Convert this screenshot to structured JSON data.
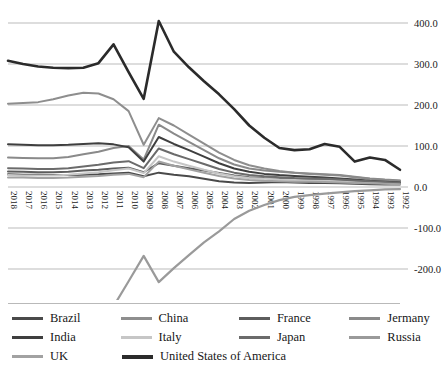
{
  "chart_data": {
    "type": "line",
    "title": "",
    "subtitle": "",
    "xlabel": "",
    "ylabel": "",
    "grid": true,
    "legend_position": "bottom",
    "x_axis_reversed": true,
    "ylim": [
      -300,
      400
    ],
    "ytick_step": 100,
    "ytick_labels": [
      "400.0",
      "300.0",
      "200.0",
      "100.0",
      "0.0",
      "-100.0",
      "-200.0",
      "-300.0"
    ],
    "ytick_values": [
      400,
      300,
      200,
      100,
      0,
      -100,
      -200,
      -300
    ],
    "categories": [
      "2018",
      "2017",
      "2016",
      "2015",
      "2014",
      "2013",
      "2012",
      "2011",
      "2010",
      "2009",
      "2008",
      "2007",
      "2006",
      "2005",
      "2004",
      "2003",
      "2002",
      "2001",
      "2000",
      "1999",
      "1998",
      "1997",
      "1996",
      "1995",
      "1994",
      "1993",
      "1992"
    ],
    "series": [
      {
        "name": "Brazil",
        "color": "#4a4a4a",
        "width": 2.0,
        "values": [
          31,
          30,
          30,
          29,
          29,
          30,
          31,
          33,
          35,
          26,
          35,
          30,
          26,
          20,
          14,
          11,
          10,
          11,
          12,
          11,
          10,
          10,
          9,
          8,
          7,
          6,
          6
        ]
      },
      {
        "name": "China",
        "color": "#8e8e8e",
        "width": 2.0,
        "values": [
          203,
          205,
          207,
          214,
          223,
          230,
          228,
          214,
          185,
          103,
          168,
          150,
          128,
          106,
          84,
          66,
          53,
          45,
          39,
          35,
          32,
          30,
          28,
          24,
          20,
          17,
          15
        ]
      },
      {
        "name": "France",
        "color": "#5d5d5d",
        "width": 2.0,
        "values": [
          38,
          37,
          36,
          36,
          37,
          40,
          42,
          45,
          47,
          36,
          58,
          52,
          46,
          40,
          34,
          28,
          24,
          22,
          21,
          20,
          19,
          18,
          17,
          16,
          14,
          12,
          11
        ]
      },
      {
        "name": "Jermany",
        "color": "#8a8a8a",
        "width": 2.0,
        "values": [
          72,
          71,
          70,
          70,
          73,
          80,
          86,
          95,
          100,
          67,
          152,
          130,
          110,
          90,
          70,
          55,
          45,
          40,
          37,
          35,
          33,
          31,
          29,
          25,
          21,
          18,
          16
        ]
      },
      {
        "name": "India",
        "color": "#3f3f3f",
        "width": 2.0,
        "values": [
          104,
          103,
          102,
          102,
          103,
          105,
          107,
          104,
          97,
          62,
          122,
          105,
          90,
          74,
          58,
          45,
          37,
          32,
          29,
          27,
          25,
          23,
          21,
          18,
          15,
          13,
          11
        ]
      },
      {
        "name": "Italy",
        "color": "#c6c6c6",
        "width": 2.0,
        "values": [
          29,
          28,
          28,
          28,
          30,
          33,
          36,
          41,
          45,
          34,
          75,
          62,
          52,
          42,
          33,
          26,
          22,
          20,
          18,
          17,
          16,
          15,
          14,
          12,
          11,
          9,
          8
        ]
      },
      {
        "name": "Japan",
        "color": "#6b6b6b",
        "width": 2.0,
        "values": [
          46,
          45,
          44,
          44,
          46,
          50,
          54,
          60,
          63,
          46,
          94,
          80,
          68,
          56,
          44,
          35,
          29,
          26,
          24,
          22,
          21,
          20,
          18,
          16,
          14,
          12,
          10
        ]
      },
      {
        "name": "Russia",
        "color": "#9a9a9a",
        "width": 2.2,
        "values": [
          -278,
          -278,
          -279,
          -282,
          -286,
          -291,
          -292,
          -291,
          -230,
          -168,
          -232,
          -198,
          -166,
          -135,
          -108,
          -78,
          -58,
          -44,
          -32,
          -24,
          -20,
          -16,
          -13,
          -10,
          -8,
          -6,
          -5
        ]
      },
      {
        "name": "UK",
        "color": "#a2a2a2",
        "width": 2.0,
        "values": [
          23,
          23,
          22,
          22,
          23,
          25,
          27,
          30,
          32,
          24,
          62,
          52,
          43,
          35,
          27,
          21,
          17,
          15,
          14,
          13,
          13,
          12,
          11,
          10,
          9,
          8,
          7
        ]
      },
      {
        "name": "United States of America",
        "color": "#2b2b2b",
        "width": 2.6,
        "values": [
          308,
          300,
          294,
          291,
          290,
          291,
          302,
          348,
          280,
          215,
          405,
          330,
          292,
          258,
          226,
          190,
          150,
          120,
          95,
          90,
          92,
          105,
          98,
          62,
          72,
          66,
          42
        ]
      }
    ]
  },
  "legend": {
    "rows": [
      [
        {
          "label": "Brazil",
          "color": "#4a4a4a",
          "thickness": 3
        },
        {
          "label": "China",
          "color": "#8e8e8e",
          "thickness": 3
        },
        {
          "label": "France",
          "color": "#5d5d5d",
          "thickness": 3
        },
        {
          "label": "Jermany",
          "color": "#8a8a8a",
          "thickness": 3
        }
      ],
      [
        {
          "label": "India",
          "color": "#3f3f3f",
          "thickness": 3
        },
        {
          "label": "Italy",
          "color": "#c6c6c6",
          "thickness": 3
        },
        {
          "label": "Japan",
          "color": "#6b6b6b",
          "thickness": 3
        },
        {
          "label": "Russia",
          "color": "#9a9a9a",
          "thickness": 3
        }
      ],
      [
        {
          "label": "UK",
          "color": "#a2a2a2",
          "thickness": 3
        },
        {
          "label": "United States of America",
          "color": "#2b2b2b",
          "thickness": 4
        }
      ]
    ]
  },
  "style": {
    "gridline_color": "#a9a9a9",
    "separator_color": "#b9b9b9",
    "background": "#ffffff",
    "text_color": "#171717"
  }
}
